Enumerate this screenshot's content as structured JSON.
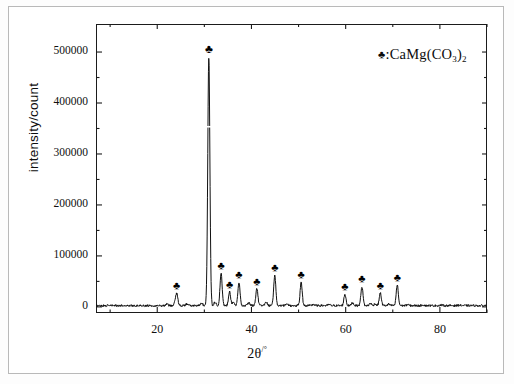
{
  "figure": {
    "kind": "xrd-diffractogram",
    "background_color": "#ffffff",
    "line_color": "#111111",
    "frame_color": "#1b1b1b"
  },
  "legend": {
    "marker_glyph": "♣",
    "separator": ":",
    "formula_lead": "CaMg(CO",
    "formula_sub1": "3",
    "formula_mid": ")",
    "formula_sub2": "2",
    "full_text": "♣:CaMg(CO3)2"
  },
  "axes": {
    "x_title_main": "2θ",
    "x_title_unit": "/°",
    "y_title": "intensity/count"
  },
  "chart_data": {
    "type": "line",
    "title": "",
    "subtitle": "",
    "xlabel": "2θ/°",
    "ylabel": "intensity/count",
    "xlim": [
      7,
      90
    ],
    "ylim": [
      -12000,
      555000
    ],
    "xticks": [
      20,
      40,
      60,
      80
    ],
    "xtick_labels": [
      "20",
      "40",
      "60",
      "80"
    ],
    "x_minor_ticks": [
      10,
      30,
      50,
      70,
      90
    ],
    "yticks": [
      0,
      100000,
      200000,
      300000,
      400000,
      500000
    ],
    "ytick_labels": [
      "0",
      "100000",
      "200000",
      "300000",
      "400000",
      "500000"
    ],
    "y_minor_ticks": [
      50000,
      150000,
      250000,
      350000,
      450000
    ],
    "grid": false,
    "legend_position": "upper right",
    "legend_entries": [
      "♣:CaMg(CO3)2"
    ],
    "series": [
      {
        "name": "CaMg(CO3)2 diffraction pattern",
        "baseline": 2500,
        "peaks": [
          {
            "two_theta": 24.1,
            "intensity": 27000,
            "width": 0.35,
            "marked": true
          },
          {
            "two_theta": 30.95,
            "intensity": 490000,
            "width": 0.3,
            "marked": true
          },
          {
            "two_theta": 33.55,
            "intensity": 66000,
            "width": 0.3,
            "marked": true
          },
          {
            "two_theta": 35.35,
            "intensity": 30000,
            "width": 0.3,
            "marked": true
          },
          {
            "two_theta": 37.35,
            "intensity": 48000,
            "width": 0.3,
            "marked": true
          },
          {
            "two_theta": 41.15,
            "intensity": 36000,
            "width": 0.3,
            "marked": true
          },
          {
            "two_theta": 44.95,
            "intensity": 62000,
            "width": 0.3,
            "marked": true
          },
          {
            "two_theta": 50.55,
            "intensity": 48000,
            "width": 0.3,
            "marked": true
          },
          {
            "two_theta": 59.85,
            "intensity": 25000,
            "width": 0.3,
            "marked": true
          },
          {
            "two_theta": 63.45,
            "intensity": 40000,
            "width": 0.3,
            "marked": true
          },
          {
            "two_theta": 67.35,
            "intensity": 27000,
            "width": 0.3,
            "marked": true
          },
          {
            "two_theta": 70.95,
            "intensity": 43000,
            "width": 0.3,
            "marked": true
          },
          {
            "two_theta": 22.05,
            "intensity": 6000,
            "width": 0.3,
            "marked": false
          },
          {
            "two_theta": 26.25,
            "intensity": 5500,
            "width": 0.3,
            "marked": false
          },
          {
            "two_theta": 29.45,
            "intensity": 7000,
            "width": 0.3,
            "marked": false
          },
          {
            "two_theta": 32.25,
            "intensity": 9000,
            "width": 0.3,
            "marked": false
          },
          {
            "two_theta": 36.15,
            "intensity": 10000,
            "width": 0.3,
            "marked": false
          },
          {
            "two_theta": 39.45,
            "intensity": 8000,
            "width": 0.3,
            "marked": false
          },
          {
            "two_theta": 43.15,
            "intensity": 9000,
            "width": 0.3,
            "marked": false
          },
          {
            "two_theta": 47.55,
            "intensity": 6500,
            "width": 0.3,
            "marked": false
          },
          {
            "two_theta": 53.15,
            "intensity": 5000,
            "width": 0.3,
            "marked": false
          },
          {
            "two_theta": 56.45,
            "intensity": 4500,
            "width": 0.3,
            "marked": false
          },
          {
            "two_theta": 61.45,
            "intensity": 8000,
            "width": 0.3,
            "marked": false
          },
          {
            "two_theta": 65.25,
            "intensity": 7000,
            "width": 0.3,
            "marked": false
          },
          {
            "two_theta": 66.25,
            "intensity": 6000,
            "width": 0.3,
            "marked": false
          },
          {
            "two_theta": 69.15,
            "intensity": 5500,
            "width": 0.3,
            "marked": false
          },
          {
            "two_theta": 73.15,
            "intensity": 4500,
            "width": 0.3,
            "marked": false
          },
          {
            "two_theta": 76.45,
            "intensity": 4000,
            "width": 0.3,
            "marked": false
          },
          {
            "two_theta": 80.25,
            "intensity": 3500,
            "width": 0.3,
            "marked": false
          },
          {
            "two_theta": 84.15,
            "intensity": 3500,
            "width": 0.3,
            "marked": false
          }
        ]
      }
    ]
  }
}
